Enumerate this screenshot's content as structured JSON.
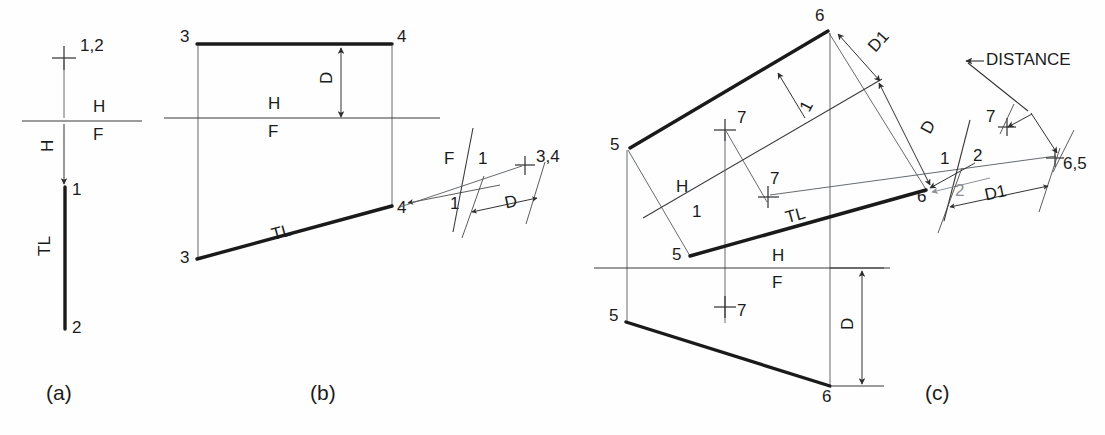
{
  "figure": {
    "background_color": "#fefefe",
    "line_color": "#1a1a1a",
    "projection_color": "#555a5f",
    "gray_accent_color": "#8d9196"
  },
  "panels": [
    {
      "key": "a",
      "caption": "(a)",
      "labels": {
        "point_top": "1,2",
        "fold_h": "H",
        "fold_f": "F",
        "depth_h": "H",
        "point_1": "1",
        "point_2": "2",
        "true_length": "TL"
      }
    },
    {
      "key": "b",
      "caption": "(b)",
      "labels": {
        "top_left_point": "3",
        "top_right_point": "4",
        "fold_h": "H",
        "fold_f": "F",
        "dim_d": "D",
        "front_left_point": "3",
        "front_right_point": "4",
        "true_length": "TL",
        "aux_fold_f": "F",
        "aux_fold_1": "1",
        "aux_arrow_label": "1",
        "aux_point": "3,4",
        "aux_dim_d": "D"
      }
    },
    {
      "key": "c",
      "caption": "(c)",
      "labels": {
        "top_point_6": "6",
        "top_point_5": "5",
        "aux1_point_5": "5",
        "aux1_point_6": "6",
        "aux1_true_length": "TL",
        "sight_arrow_1": "1",
        "plus_7_upper": "7",
        "plus_7_aux": "7",
        "fold_h_label": "H",
        "fold_1_label": "1",
        "fold_h_front": "H",
        "fold_f_front": "F",
        "front_point_5": "5",
        "front_point_6": "6",
        "plus_7_front": "7",
        "dim_d_front": "D",
        "dim_d1_upper": "D1",
        "dim_d_lower": "D",
        "fold_1_label2": "1",
        "fold_2_label": "2",
        "sight_arrow_2": "2",
        "point_view_7": "7",
        "point_view_65": "6,5",
        "dim_d1_right": "D1",
        "distance_callout": "DISTANCE"
      }
    }
  ]
}
